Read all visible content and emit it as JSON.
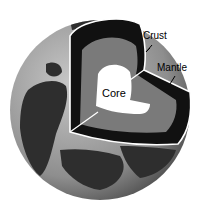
{
  "diagram": {
    "labels": {
      "crust": "Crust",
      "mantle": "Mantle",
      "core": "Core"
    },
    "colors": {
      "ocean": "#9a9a9a",
      "land": "#3a3a3a",
      "crust_band": "#111111",
      "mantle": "#7a7a7a",
      "core": "#ffffff",
      "outline": "#ffffff"
    }
  }
}
